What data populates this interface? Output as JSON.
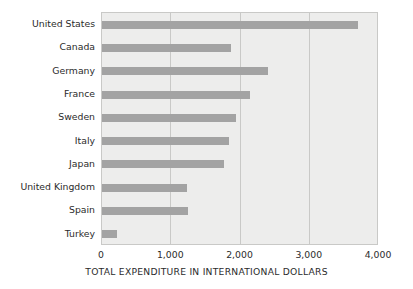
{
  "chart_data": {
    "type": "bar",
    "orientation": "horizontal",
    "title": "",
    "xlabel": "TOTAL EXPENDITURE IN INTERNATIONAL DOLLARS",
    "ylabel": "",
    "xlim": [
      0,
      4000
    ],
    "grid": "vertical",
    "legend": "none",
    "categories": [
      "United States",
      "Canada",
      "Germany",
      "France",
      "Sweden",
      "Italy",
      "Japan",
      "United Kingdom",
      "Spain",
      "Turkey"
    ],
    "values": [
      3700,
      1860,
      2400,
      2140,
      1940,
      1835,
      1765,
      1230,
      1235,
      215
    ],
    "xticks": [
      0,
      1000,
      2000,
      3000,
      4000
    ],
    "xticklabels": [
      "0",
      "1,000",
      "2,000",
      "3,000",
      "4,000"
    ],
    "colors": {
      "bar": "#a3a3a3",
      "plot_background": "#ededec",
      "page_background": "#ffffff",
      "gridline": "#c9c9c7",
      "axis_border": "#c9c9c7",
      "text": "#2b2b2b"
    }
  }
}
